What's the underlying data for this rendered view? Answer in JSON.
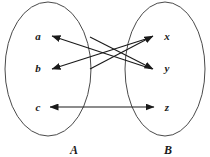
{
  "diagram": {
    "type": "set-mapping-arrow-diagram",
    "title": "",
    "background_color": "#ffffff",
    "stroke_color": "#1a1a1a",
    "sets": [
      {
        "id": "A",
        "label": "A",
        "label_x": 74,
        "label_y": 150,
        "ellipse": {
          "cx": 48,
          "cy": 69,
          "rx": 43,
          "ry": 67
        },
        "elements": [
          {
            "id": "a",
            "label": "a",
            "x": 38,
            "y": 36
          },
          {
            "id": "b",
            "label": "b",
            "x": 38,
            "y": 68
          },
          {
            "id": "c",
            "label": "c",
            "x": 38,
            "y": 107
          }
        ]
      },
      {
        "id": "B",
        "label": "B",
        "label_x": 168,
        "label_y": 150,
        "ellipse": {
          "cx": 165,
          "cy": 69,
          "rx": 40,
          "ry": 67
        },
        "elements": [
          {
            "id": "x",
            "label": "x",
            "x": 167,
            "y": 36
          },
          {
            "id": "y",
            "label": "y",
            "x": 167,
            "y": 68
          },
          {
            "id": "z",
            "label": "z",
            "x": 167,
            "y": 107
          }
        ]
      }
    ],
    "arrows": [
      {
        "id": "arrow-y-to-a",
        "name": "arrow-from-y-to-a",
        "from": "y",
        "to": "a",
        "direction": "single",
        "x1": 152,
        "y1": 69,
        "x2": 52,
        "y2": 36
      },
      {
        "id": "arrow-x-to-b",
        "name": "arrow-from-x-to-b",
        "from": "x",
        "to": "b",
        "direction": "single",
        "x1": 152,
        "y1": 37,
        "x2": 52,
        "y2": 69
      },
      {
        "id": "arrow-b-to-x",
        "name": "arrow-to-x",
        "from": "b",
        "to": "x",
        "direction": "single",
        "x1": 90,
        "y1": 69,
        "x2": 153,
        "y2": 36
      },
      {
        "id": "arrow-a-to-y",
        "name": "arrow-to-y",
        "from": "a",
        "to": "y",
        "direction": "single",
        "x1": 90,
        "y1": 37,
        "x2": 153,
        "y2": 69
      },
      {
        "id": "arrow-c-z",
        "name": "arrow-between-c-and-z",
        "from": "c",
        "to": "z",
        "direction": "double",
        "x1": 50,
        "y1": 107,
        "x2": 154,
        "y2": 107
      }
    ]
  }
}
